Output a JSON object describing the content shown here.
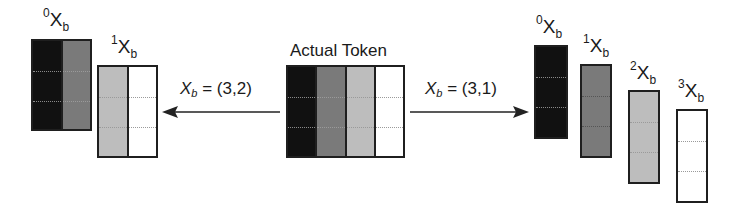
{
  "center": {
    "title": "Actual Token",
    "columns": [
      {
        "color": "#111111"
      },
      {
        "color": "#7a7a7a"
      },
      {
        "color": "#bdbdbd"
      },
      {
        "color": "#ffffff"
      }
    ],
    "rows": 3
  },
  "left_arrow": {
    "direction": "left",
    "label_var": "X",
    "label_sub": "b",
    "label_value": "= (3,2)"
  },
  "right_arrow": {
    "direction": "right",
    "label_var": "X",
    "label_sub": "b",
    "label_value": "= (3,1)"
  },
  "left_split": {
    "blocks": [
      {
        "prefix": "0",
        "name": "X",
        "sub": "b",
        "columns": [
          "#111111",
          "#7a7a7a"
        ]
      },
      {
        "prefix": "1",
        "name": "X",
        "sub": "b",
        "columns": [
          "#bdbdbd",
          "#ffffff"
        ]
      }
    ]
  },
  "right_split": {
    "blocks": [
      {
        "prefix": "0",
        "name": "X",
        "sub": "b",
        "columns": [
          "#111111"
        ]
      },
      {
        "prefix": "1",
        "name": "X",
        "sub": "b",
        "columns": [
          "#7a7a7a"
        ]
      },
      {
        "prefix": "2",
        "name": "X",
        "sub": "b",
        "columns": [
          "#bdbdbd"
        ]
      },
      {
        "prefix": "3",
        "name": "X",
        "sub": "b",
        "columns": [
          "#ffffff"
        ]
      }
    ]
  }
}
